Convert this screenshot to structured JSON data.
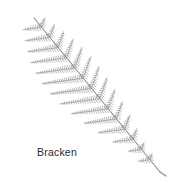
{
  "illustration": {
    "subject": "fern frond",
    "label": "Bracken",
    "colors": {
      "background": "#ffffff",
      "stem": "#8a8a8a",
      "leaflet": "#9a9a9a",
      "label": "#2a2a2a"
    },
    "frond": {
      "tip": [
        34,
        18
      ],
      "base": [
        160,
        172
      ],
      "pinna_count": 14
    }
  }
}
